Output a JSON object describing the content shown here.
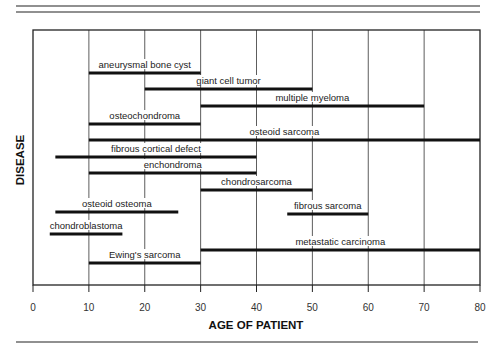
{
  "chart_data": {
    "type": "range-bar",
    "title": "",
    "xlabel": "AGE OF PATIENT",
    "ylabel": "DISEASE",
    "xlim": [
      0,
      80
    ],
    "xticks": [
      0,
      10,
      20,
      30,
      40,
      50,
      60,
      70,
      80
    ],
    "xtick_labels": [
      "0",
      "10",
      "20",
      "30",
      "40",
      "50",
      "60",
      "70",
      "80"
    ],
    "grid": "vertical",
    "legend": "none",
    "series": [
      {
        "name": "aneurysmal  bone cyst",
        "start": 10,
        "end": 30
      },
      {
        "name": "giant cell tumor",
        "start": 20,
        "end": 50
      },
      {
        "name": "multiple myeloma",
        "start": 30,
        "end": 70
      },
      {
        "name": "osteochondroma",
        "start": 10,
        "end": 30
      },
      {
        "name": "osteoid sarcoma",
        "start": 10,
        "end": 80
      },
      {
        "name": "fibrous cortical defect",
        "start": 4,
        "end": 40
      },
      {
        "name": "enchondroma",
        "start": 10,
        "end": 40
      },
      {
        "name": "chondrosarcoma",
        "start": 30,
        "end": 50
      },
      {
        "name": "osteoid osteoma",
        "start": 4,
        "end": 26
      },
      {
        "name": "fibrous sarcoma",
        "start": 45.5,
        "end": 60
      },
      {
        "name": "chondroblastoma",
        "start": 3,
        "end": 16
      },
      {
        "name": "metastatic carcinoma",
        "start": 30,
        "end": 80
      },
      {
        "name": "Ewing's sarcoma",
        "start": 10,
        "end": 30
      }
    ]
  }
}
